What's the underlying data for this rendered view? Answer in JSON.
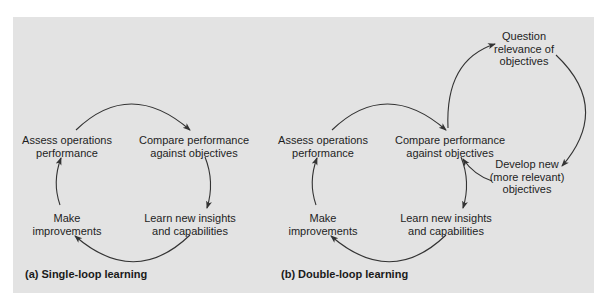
{
  "colors": {
    "panel_bg": "#e3e3e3",
    "page_bg": "#ffffff",
    "text": "#1e1e1e",
    "arrow": "#333333"
  },
  "single_loop": {
    "caption": "(a) Single-loop learning",
    "nodes": {
      "assess": {
        "line1": "Assess operations",
        "line2": "performance"
      },
      "compare": {
        "line1": "Compare performance",
        "line2": "against objectives"
      },
      "learn": {
        "line1": "Learn new insights",
        "line2": "and capabilities"
      },
      "make": {
        "line1": "Make",
        "line2": "improvements"
      }
    }
  },
  "double_loop": {
    "caption": "(b) Double-loop learning",
    "nodes": {
      "assess": {
        "line1": "Assess operations",
        "line2": "performance"
      },
      "compare": {
        "line1": "Compare performance",
        "line2": "against objectives"
      },
      "learn": {
        "line1": "Learn new insights",
        "line2": "and capabilities"
      },
      "make": {
        "line1": "Make",
        "line2": "improvements"
      },
      "question": {
        "line1": "Question",
        "line2": "relevance of",
        "line3": "objectives"
      },
      "develop": {
        "line1": "Develop new",
        "line2": "(more relevant)",
        "line3": "objectives"
      }
    }
  }
}
